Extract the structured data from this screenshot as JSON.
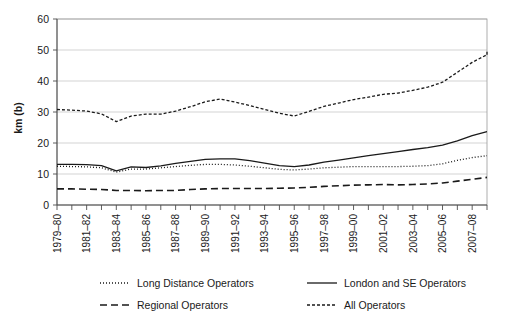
{
  "chart_data": {
    "type": "line",
    "title": "",
    "subtitle": "",
    "xlabel": "",
    "ylabel": "km (b)",
    "ylim": [
      0,
      60
    ],
    "yticks": [
      0,
      10,
      20,
      30,
      40,
      50,
      60
    ],
    "grid": true,
    "legend_position": "bottom",
    "x": [
      "1979–80",
      "1980–81",
      "1981–82",
      "1982–83",
      "1983–84",
      "1984–85",
      "1985–86",
      "1986–87",
      "1987–88",
      "1988–89",
      "1989–90",
      "1990–91",
      "1991–92",
      "1992–93",
      "1993–94",
      "1994–95",
      "1995–96",
      "1996–97",
      "1997–98",
      "1998–99",
      "1999–00",
      "2000–01",
      "2001–02",
      "2002–03",
      "2003–04",
      "2004–05",
      "2005–06",
      "2006–07",
      "2007–08",
      "2008–09"
    ],
    "xtick_labels": [
      "1979–80",
      "1981–82",
      "1983–84",
      "1985–86",
      "1987–88",
      "1989–90",
      "1991–92",
      "1993–94",
      "1995–96",
      "1997–98",
      "1999–00",
      "2001–02",
      "2003–04",
      "2005–06",
      "2007–08"
    ],
    "xtick_indices": [
      0,
      2,
      4,
      6,
      8,
      10,
      12,
      14,
      16,
      18,
      20,
      22,
      24,
      26,
      28
    ],
    "series": [
      {
        "name": "Long Distance Operators",
        "style": "dotted",
        "dash": "1,2",
        "width": 1.3,
        "color": "#1a1a1a",
        "values": [
          12.5,
          12.4,
          12.3,
          12.0,
          10.6,
          11.6,
          11.6,
          12.0,
          12.4,
          12.8,
          13.1,
          13.1,
          12.9,
          12.5,
          12.0,
          11.5,
          11.3,
          11.6,
          12.0,
          12.2,
          12.4,
          12.4,
          12.4,
          12.4,
          12.5,
          12.7,
          13.3,
          14.4,
          15.3,
          15.9
        ]
      },
      {
        "name": "London and SE Operators",
        "style": "solid",
        "dash": "none",
        "width": 1.3,
        "color": "#1a1a1a",
        "values": [
          13.1,
          13.1,
          13.0,
          12.7,
          11.0,
          12.3,
          12.1,
          12.6,
          13.4,
          14.1,
          14.7,
          14.9,
          14.9,
          14.3,
          13.5,
          12.7,
          12.4,
          12.9,
          13.8,
          14.5,
          15.2,
          15.9,
          16.6,
          17.2,
          17.9,
          18.5,
          19.3,
          20.7,
          22.4,
          23.7
        ]
      },
      {
        "name": "Regional Operators",
        "style": "dashed-long",
        "dash": "7,4",
        "width": 1.6,
        "color": "#1a1a1a",
        "values": [
          5.2,
          5.2,
          5.1,
          5.0,
          4.7,
          4.7,
          4.6,
          4.7,
          4.7,
          5.0,
          5.2,
          5.3,
          5.3,
          5.3,
          5.3,
          5.4,
          5.5,
          5.7,
          6.0,
          6.2,
          6.4,
          6.5,
          6.6,
          6.5,
          6.6,
          6.8,
          7.1,
          7.7,
          8.3,
          8.9
        ]
      },
      {
        "name": "All Operators",
        "style": "dashed-short",
        "dash": "3,2",
        "width": 1.3,
        "color": "#1a1a1a",
        "values": [
          30.8,
          30.6,
          30.3,
          29.4,
          26.9,
          28.7,
          29.3,
          29.3,
          30.3,
          31.7,
          33.3,
          34.2,
          33.2,
          32.1,
          30.8,
          29.6,
          28.7,
          30.2,
          31.8,
          32.9,
          34.0,
          34.8,
          35.7,
          36.1,
          37.0,
          38.0,
          39.6,
          42.8,
          46.0,
          48.5
        ]
      }
    ],
    "final_point": {
      "series": "All Operators",
      "value": 50.0
    }
  },
  "legend": {
    "entries": [
      {
        "label": "Long Distance Operators",
        "marker": "dotted-line-swatch"
      },
      {
        "label": "London and SE Operators",
        "marker": "solid-line-swatch"
      },
      {
        "label": "Regional Operators",
        "marker": "long-dash-line-swatch"
      },
      {
        "label": "All Operators",
        "marker": "short-dash-line-swatch"
      }
    ]
  }
}
